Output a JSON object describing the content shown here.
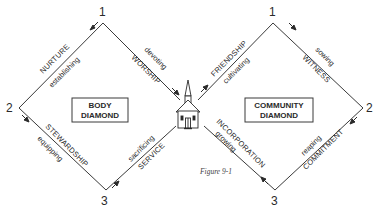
{
  "diagram": {
    "caption": "Figure 9-1",
    "body_diamond": {
      "title_line1": "BODY",
      "title_line2": "DIAMOND",
      "vertices": {
        "top": "1",
        "left": "2",
        "bottom": "3"
      },
      "edges": {
        "top_right": {
          "name": "WORSHIP",
          "verb": "devoting"
        },
        "top_left": {
          "name": "NURTURE",
          "verb": "establishing"
        },
        "bottom_left": {
          "name": "STEWARDSHIP",
          "verb": "equipping"
        },
        "bottom_right": {
          "name": "SERVICE",
          "verb": "sacrificing"
        }
      }
    },
    "community_diamond": {
      "title_line1": "COMMUNITY",
      "title_line2": "DIAMOND",
      "vertices": {
        "top": "1",
        "right": "2",
        "bottom": "3"
      },
      "edges": {
        "top_left": {
          "name": "FRIENDSHIP",
          "verb": "cultivating"
        },
        "top_right": {
          "name": "WITNESS",
          "verb": "sowing"
        },
        "bottom_right": {
          "name": "COMMITMENT",
          "verb": "reaping"
        },
        "bottom_left": {
          "name": "INCORPORATION",
          "verb": "growing"
        }
      }
    },
    "center_icon": "church-icon",
    "colors": {
      "line": "#3a3a3a",
      "text": "#2a2a2a",
      "background": "#ffffff"
    }
  }
}
